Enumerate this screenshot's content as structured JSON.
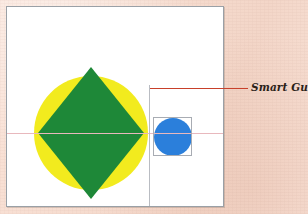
{
  "document": {
    "type": "illustration-figure",
    "description": "Vector drawing canvas showing alignment smart guides"
  },
  "canvas": {
    "background_color": "#ffffff",
    "border_color": "#9aa0a6"
  },
  "page": {
    "background_color": "#f7ded2"
  },
  "shapes": [
    {
      "name": "yellow-circle",
      "type": "circle",
      "fill": "#f2eb1e",
      "cx": 84,
      "cy": 126,
      "r": 57
    },
    {
      "name": "green-diamond",
      "type": "diamond",
      "fill": "#1e8838",
      "cx": 84,
      "cy": 126,
      "rx": 53,
      "ry": 66
    },
    {
      "name": "blue-circle",
      "type": "circle",
      "fill": "#2b7fdb",
      "cx": 166,
      "cy": 130,
      "r": 19
    }
  ],
  "guides": {
    "horizontal": {
      "label": "horizontal-alignment-guide",
      "color": "#e8b8bd",
      "y": 126
    },
    "vertical": {
      "label": "vertical-alignment-guide",
      "color": "#b9bcc2",
      "x": 142
    }
  },
  "selection": {
    "label": "blue-circle-selection-box",
    "border_color": "#a8acb3"
  },
  "callout": {
    "label": "Smart Guide",
    "line_color": "#c8402a",
    "text_color": "#2a2118"
  }
}
